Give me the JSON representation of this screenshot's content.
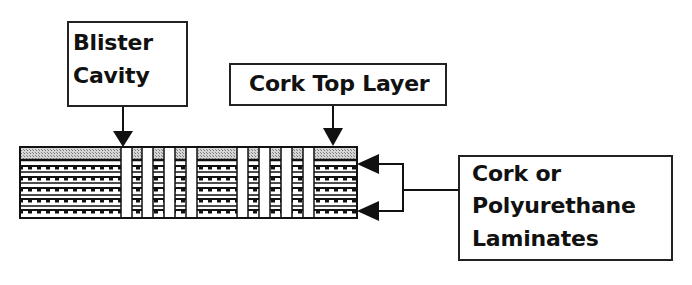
{
  "diagram": {
    "labels": {
      "blister_cavity": {
        "line1": "Blister",
        "line2": "Cavity"
      },
      "cork_top_layer": {
        "text": "Cork Top Layer"
      },
      "laminates": {
        "line1": "Cork or",
        "line2": "Polyurethane",
        "line3": "Laminates"
      }
    },
    "structure": {
      "slab": {
        "x": 20,
        "y": 147,
        "width": 337,
        "height": 71
      },
      "top_layer_height": 13,
      "laminate_rows": 5,
      "cavities_x": [
        121,
        142,
        164,
        186,
        237,
        259,
        281,
        303
      ],
      "cavity_width": 11
    },
    "colors": {
      "line": "#1a1a1a",
      "cork_fill": "#b8b8b8",
      "background": "#ffffff"
    }
  }
}
